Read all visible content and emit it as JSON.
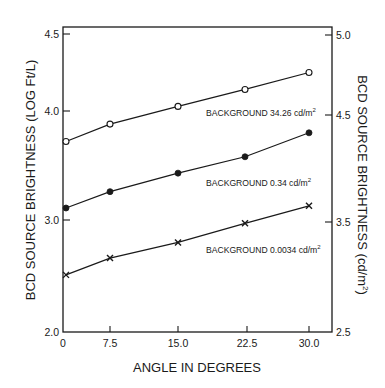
{
  "chart_data": {
    "type": "line",
    "title": "",
    "xlabel": "ANGLE IN DEGREES",
    "ylabel": "BCD SOURCE BRIGHTNESS  (LOG Ft/L)",
    "ylabel_right": "BCD SOURCE BRIGHTNESS (cd/m²)",
    "x": [
      0,
      7.5,
      15.0,
      22.5,
      30.0
    ],
    "x_ticks": [
      "0",
      "7.5",
      "15.0",
      "22.5",
      "30.0"
    ],
    "y_ticks_left": [
      "4.5",
      "4.0",
      "3.0",
      "2.0"
    ],
    "y_ticks_right": [
      "5.0",
      "4.5",
      "3.5",
      "2.5"
    ],
    "ylim": [
      2.0,
      4.5
    ],
    "ylim_right": [
      2.5,
      5.0
    ],
    "grid": false,
    "legend": "inline labels beneath each series",
    "series": [
      {
        "name": "BACKGROUND 34.26 cd/m²",
        "marker": "open-circle",
        "values": [
          3.72,
          3.88,
          4.03,
          4.14,
          4.25
        ]
      },
      {
        "name": "BACKGROUND 0.34 cd/m²",
        "marker": "filled-circle",
        "values": [
          3.11,
          3.26,
          3.43,
          3.58,
          3.8
        ]
      },
      {
        "name": "BACKGROUND 0.0034 cd/m²",
        "marker": "cross",
        "values": [
          2.51,
          2.66,
          2.8,
          2.97,
          3.13
        ]
      }
    ]
  },
  "labels": {
    "xlabel": "ANGLE IN DEGREES",
    "ylabel_left": "BCD SOURCE BRIGHTNESS  (LOG Ft/L)",
    "ylabel_right_main": "BCD SOURCE BRIGHTNESS (cd/m",
    "ylabel_right_sup": "2",
    "ylabel_right_end": ")",
    "series": [
      {
        "text": "BACKGROUND 34.26 cd/m",
        "sup": "2"
      },
      {
        "text": "BACKGROUND 0.34 cd/m",
        "sup": "2"
      },
      {
        "text": "BACKGROUND 0.0034 cd/m",
        "sup": "2"
      }
    ]
  },
  "colors": {
    "ink": "#1a1a1a",
    "background": "#ffffff"
  }
}
